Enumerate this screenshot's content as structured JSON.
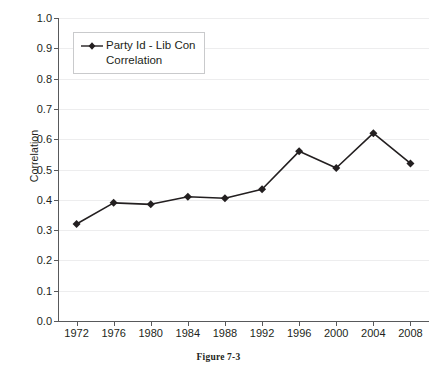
{
  "caption": "Figure 7-3",
  "axes": {
    "ylabel": "Correlation",
    "xlabel": ""
  },
  "legend": {
    "label": "Party Id - Lib Con\nCorrelation",
    "marker": "diamond-marker-icon"
  },
  "chart_data": {
    "type": "line",
    "title": "",
    "xlabel": "",
    "ylabel": "Correlation",
    "categories": [
      "1972",
      "1976",
      "1980",
      "1984",
      "1988",
      "1992",
      "1996",
      "2000",
      "2004",
      "2008"
    ],
    "x": [
      1972,
      1976,
      1980,
      1984,
      1988,
      1992,
      1996,
      2000,
      2004,
      2008
    ],
    "values": [
      0.32,
      0.39,
      0.385,
      0.41,
      0.405,
      0.435,
      0.56,
      0.505,
      0.62,
      0.52
    ],
    "series": [
      {
        "name": "Party Id - Lib Con Correlation",
        "values": [
          0.32,
          0.39,
          0.385,
          0.41,
          0.405,
          0.435,
          0.56,
          0.505,
          0.62,
          0.52
        ],
        "color": "#231f20",
        "marker": "diamond"
      }
    ],
    "ylim": [
      0.0,
      1.0
    ],
    "yticks": [
      0.0,
      0.1,
      0.2,
      0.3,
      0.4,
      0.5,
      0.6,
      0.7,
      0.8,
      0.9,
      1.0
    ],
    "ytick_labels": [
      "0.0",
      "0.1",
      "0.2",
      "0.3",
      "0.4",
      "0.5",
      "0.6",
      "0.7",
      "0.8",
      "0.9",
      "1.0"
    ],
    "xtick_labels": [
      "1972",
      "1976",
      "1980",
      "1984",
      "1988",
      "1992",
      "1996",
      "2000",
      "2004",
      "2008"
    ],
    "grid": "horizontal",
    "grid_color": "#ededee",
    "legend_position": "upper-left",
    "axis_color": "#58595b",
    "background": "#ffffff"
  }
}
